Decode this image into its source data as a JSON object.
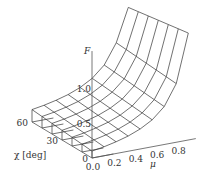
{
  "chart_data": {
    "type": "surface3d",
    "title": "",
    "xlabel": "μ",
    "ylabel": "χ [deg]",
    "zlabel": "F",
    "x_ticks": [
      "0.0",
      "0.2",
      "0.4",
      "0.6",
      "0.8"
    ],
    "y_ticks": [
      "0",
      "30",
      "60"
    ],
    "z_ticks": [
      "0.5",
      "1.0"
    ],
    "x_range": [
      0,
      0.9
    ],
    "y_range": [
      0,
      60
    ],
    "z_range": [
      0,
      1.6
    ],
    "grid_mu": [
      0,
      0.1125,
      0.225,
      0.3375,
      0.45,
      0.5625,
      0.675,
      0.7875,
      0.9
    ],
    "grid_chi": [
      0,
      10,
      20,
      30,
      40,
      50,
      60
    ],
    "surface_note": "F increases sharply as μ approaches 0.9; mild increase with χ",
    "F_values_chi0": [
      0.1,
      0.13,
      0.17,
      0.22,
      0.29,
      0.39,
      0.55,
      0.85,
      1.55
    ],
    "F_values_chi60": [
      0.18,
      0.21,
      0.25,
      0.3,
      0.37,
      0.47,
      0.63,
      0.92,
      1.4
    ]
  },
  "labels": {
    "z_axis": "F",
    "y_axis": "χ [deg]",
    "x_axis": "μ"
  }
}
